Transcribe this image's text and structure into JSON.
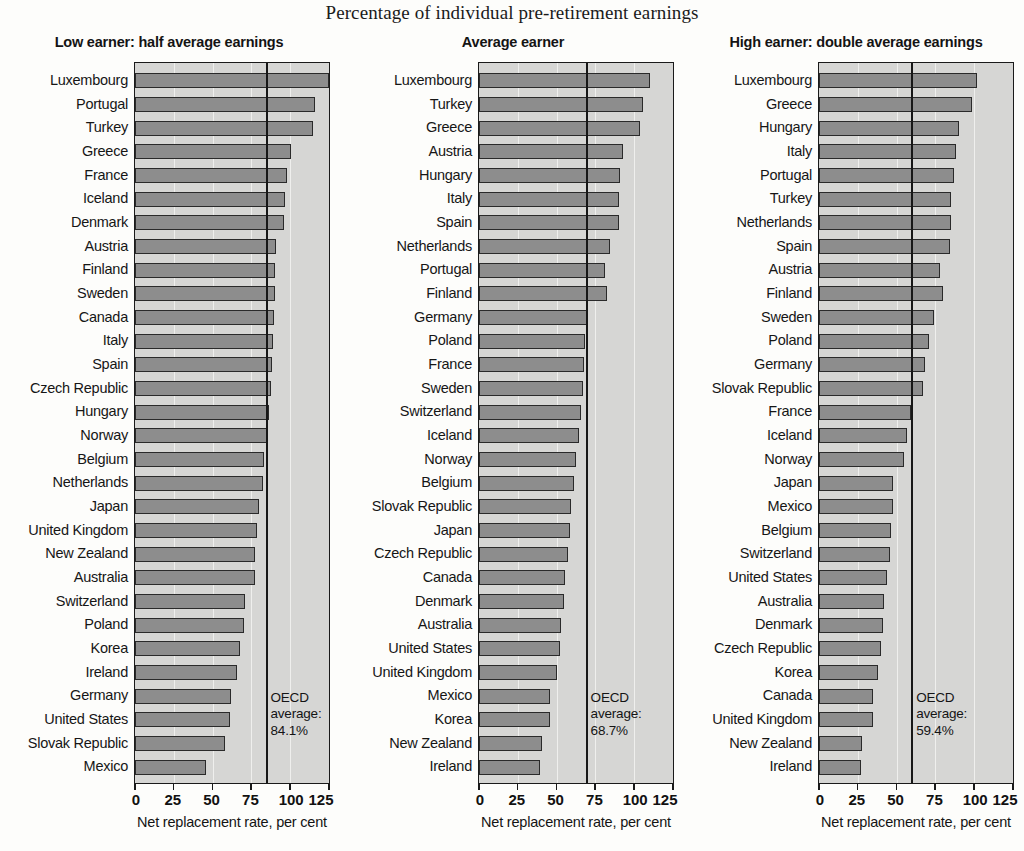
{
  "figure": {
    "title": "Percentage of individual pre-retirement earnings"
  },
  "chart_data": [
    {
      "type": "bar",
      "orientation": "horizontal",
      "title": "Low earner: half average earnings",
      "xlabel": "Net replacement rate, per cent",
      "ylabel": "",
      "xlim": [
        0,
        125
      ],
      "xticks": [
        0,
        25,
        50,
        75,
        100,
        125
      ],
      "grid": true,
      "legend": "none",
      "annotation": {
        "label_line1": "OECD",
        "label_line2": "average:",
        "label_line3": "84.1%",
        "value": 84.1
      },
      "categories": [
        "Luxembourg",
        "Portugal",
        "Turkey",
        "Greece",
        "France",
        "Iceland",
        "Denmark",
        "Austria",
        "Finland",
        "Sweden",
        "Canada",
        "Italy",
        "Spain",
        "Czech Republic",
        "Hungary",
        "Norway",
        "Belgium",
        "Netherlands",
        "Japan",
        "United Kingdom",
        "New Zealand",
        "Australia",
        "Switzerland",
        "Poland",
        "Korea",
        "Ireland",
        "Germany",
        "United States",
        "Slovak Republic",
        "Mexico"
      ],
      "values": [
        125.0,
        116.0,
        114.5,
        100.5,
        98.0,
        96.5,
        96.0,
        91.0,
        90.5,
        90.0,
        89.5,
        89.0,
        88.0,
        87.5,
        86.5,
        85.5,
        83.0,
        82.5,
        80.0,
        78.5,
        77.5,
        77.0,
        71.0,
        70.0,
        67.5,
        66.0,
        62.0,
        61.0,
        58.0,
        45.5
      ]
    },
    {
      "type": "bar",
      "orientation": "horizontal",
      "title": "Average earner",
      "xlabel": "Net replacement rate, per cent",
      "ylabel": "",
      "xlim": [
        0,
        125
      ],
      "xticks": [
        0,
        25,
        50,
        75,
        100,
        125
      ],
      "grid": true,
      "legend": "none",
      "annotation": {
        "label_line1": "OECD",
        "label_line2": "average:",
        "label_line3": "68.7%",
        "value": 68.7
      },
      "categories": [
        "Luxembourg",
        "Turkey",
        "Greece",
        "Austria",
        "Hungary",
        "Italy",
        "Spain",
        "Netherlands",
        "Portugal",
        "Finland",
        "Germany",
        "Poland",
        "France",
        "Sweden",
        "Switzerland",
        "Iceland",
        "Norway",
        "Belgium",
        "Slovak Republic",
        "Japan",
        "Czech Republic",
        "Canada",
        "Denmark",
        "Australia",
        "United States",
        "United Kingdom",
        "Mexico",
        "Korea",
        "New Zealand",
        "Ireland"
      ],
      "values": [
        110.0,
        105.5,
        103.5,
        93.0,
        91.0,
        90.5,
        90.0,
        84.5,
        81.5,
        82.5,
        70.0,
        68.5,
        67.5,
        67.0,
        65.5,
        64.5,
        62.5,
        61.0,
        59.0,
        58.5,
        57.5,
        55.5,
        54.5,
        53.0,
        52.0,
        50.0,
        46.0,
        45.5,
        40.5,
        39.5
      ]
    },
    {
      "type": "bar",
      "orientation": "horizontal",
      "title": "High earner: double average earnings",
      "xlabel": "Net replacement rate, per cent",
      "ylabel": "",
      "xlim": [
        0,
        125
      ],
      "xticks": [
        0,
        25,
        50,
        75,
        100,
        125
      ],
      "grid": true,
      "legend": "none",
      "annotation": {
        "label_line1": "OECD",
        "label_line2": "average:",
        "label_line3": "59.4%",
        "value": 59.4
      },
      "categories": [
        "Luxembourg",
        "Greece",
        "Hungary",
        "Italy",
        "Portugal",
        "Turkey",
        "Netherlands",
        "Spain",
        "Austria",
        "Finland",
        "Sweden",
        "Poland",
        "Germany",
        "Slovak Republic",
        "France",
        "Iceland",
        "Norway",
        "Japan",
        "Mexico",
        "Belgium",
        "Switzerland",
        "United States",
        "Australia",
        "Denmark",
        "Czech Republic",
        "Korea",
        "Canada",
        "United Kingdom",
        "New Zealand",
        "Ireland"
      ],
      "values": [
        102.0,
        98.5,
        90.5,
        88.0,
        87.0,
        85.0,
        85.0,
        84.5,
        78.0,
        80.0,
        74.0,
        71.0,
        68.0,
        67.0,
        59.0,
        57.0,
        55.0,
        48.0,
        47.5,
        46.5,
        46.0,
        44.0,
        42.0,
        41.0,
        40.0,
        38.0,
        35.0,
        34.5,
        27.5,
        27.0
      ]
    }
  ]
}
